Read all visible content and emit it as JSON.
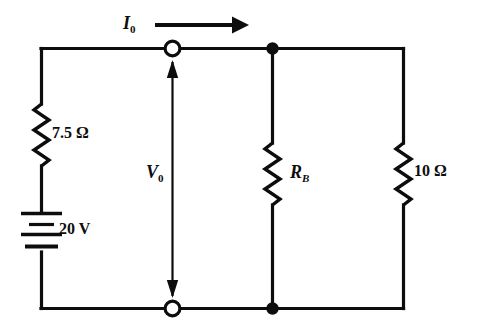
{
  "diagram": {
    "type": "circuit-schematic",
    "stroke_color": "#0d0d0d",
    "background_color": "#ffffff"
  },
  "labels": {
    "current": {
      "symbol": "I",
      "subscript": "0",
      "full": "I0"
    },
    "voltage": {
      "symbol": "V",
      "subscript": "0",
      "full": "V0"
    },
    "load_resistor": {
      "symbol": "R",
      "subscript": "B",
      "full": "RB"
    },
    "series_resistor": {
      "value": "7.5",
      "unit": "Ω",
      "full": "7.5 Ω"
    },
    "parallel_resistor": {
      "value": "10",
      "unit": "Ω",
      "full": "10 Ω"
    },
    "source": {
      "value": "20",
      "unit": "V",
      "full": "20 V"
    }
  },
  "components": [
    {
      "name": "voltage-source",
      "kind": "battery",
      "label": "20 V",
      "orientation": "vertical"
    },
    {
      "name": "series-resistor",
      "kind": "resistor",
      "label": "7.5 Ω",
      "orientation": "vertical"
    },
    {
      "name": "load-resistor",
      "kind": "resistor",
      "label": "RB",
      "orientation": "vertical"
    },
    {
      "name": "parallel-resistor",
      "kind": "resistor",
      "label": "10 Ω",
      "orientation": "vertical"
    }
  ],
  "nodes": [
    {
      "name": "top-terminal",
      "kind": "open-terminal"
    },
    {
      "name": "bottom-terminal",
      "kind": "open-terminal"
    },
    {
      "name": "top-junction",
      "kind": "filled-junction"
    },
    {
      "name": "bottom-junction",
      "kind": "filled-junction"
    }
  ],
  "annotations": [
    {
      "name": "current-arrow",
      "direction": "right",
      "label": "I0"
    },
    {
      "name": "voltage-arrow",
      "direction": "double-vertical",
      "label": "V0"
    }
  ]
}
